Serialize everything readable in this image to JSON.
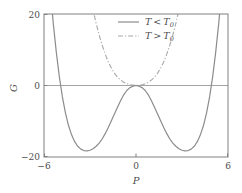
{
  "chart_data": {
    "type": "line",
    "title": "",
    "xlabel": "P",
    "ylabel": "G",
    "xlim": [
      -6,
      6
    ],
    "ylim": [
      -20,
      20
    ],
    "xticks": [
      -6,
      0,
      6
    ],
    "xtick_labels": [
      "−6",
      "0",
      "6"
    ],
    "yticks": [
      -20,
      0,
      20
    ],
    "ytick_labels": [
      "−20",
      "0",
      "20"
    ],
    "grid": false,
    "legend_position": "top-center",
    "zero_line": 0,
    "series": [
      {
        "name": "T < T0",
        "legend_label_main": "T",
        "legend_label_rel": "<",
        "legend_label_var": "T",
        "legend_label_sub": "0",
        "style": "solid",
        "color": "#8c8c8c",
        "form": "double-well",
        "description": "Double-well quartic: G = a(T-T0)P^2 + bP^4 with a(T-T0) < 0",
        "minima_x": [
          -3.2,
          3.2
        ],
        "minima_y": [
          -18.3,
          -18.3
        ],
        "local_max_x": 0,
        "local_max_y": 0,
        "x": [
          -5.6,
          -5.4,
          -5.2,
          -5.0,
          -4.8,
          -4.6,
          -4.4,
          -4.2,
          -4.0,
          -3.8,
          -3.6,
          -3.4,
          -3.2,
          -3.0,
          -2.8,
          -2.6,
          -2.4,
          -2.2,
          -2.0,
          -1.8,
          -1.6,
          -1.4,
          -1.2,
          -1.0,
          -0.8,
          -0.6,
          -0.4,
          -0.2,
          0.0,
          0.2,
          0.4,
          0.6,
          0.8,
          1.0,
          1.2,
          1.4,
          1.6,
          1.8,
          2.0,
          2.2,
          2.4,
          2.6,
          2.8,
          3.0,
          3.2,
          3.4,
          3.6,
          3.8,
          4.0,
          4.2,
          4.4,
          4.6,
          4.8,
          5.0,
          5.2,
          5.4,
          5.6
        ],
        "y": [
          27.2,
          17.6,
          9.4,
          2.5,
          -3.2,
          -7.7,
          -11.2,
          -13.8,
          -15.7,
          -17.0,
          -17.8,
          -18.2,
          -18.3,
          -18.1,
          -17.7,
          -17.0,
          -16.1,
          -14.9,
          -13.4,
          -11.7,
          -9.8,
          -7.9,
          -6.0,
          -4.2,
          -2.6,
          -1.4,
          -0.6,
          -0.2,
          0.0,
          -0.2,
          -0.6,
          -1.4,
          -2.6,
          -4.2,
          -6.0,
          -7.9,
          -9.8,
          -11.7,
          -13.4,
          -14.9,
          -16.1,
          -17.0,
          -17.7,
          -18.1,
          -18.3,
          -18.2,
          -17.8,
          -17.0,
          -15.7,
          -13.8,
          -11.2,
          -7.7,
          -3.2,
          2.5,
          9.4,
          17.6,
          27.2
        ]
      },
      {
        "name": "T > T0",
        "legend_label_main": "T",
        "legend_label_rel": ">",
        "legend_label_var": "T",
        "legend_label_sub": "0",
        "style": "dash-dot",
        "color": "#a8a8a8",
        "form": "single-well",
        "description": "Single-well quartic: G = a(T-T0)P^2 + bP^4 with a(T-T0) > 0",
        "minimum_x": 0,
        "minimum_y": 0,
        "x": [
          -3.0,
          -2.8,
          -2.6,
          -2.4,
          -2.2,
          -2.0,
          -1.8,
          -1.6,
          -1.4,
          -1.2,
          -1.0,
          -0.8,
          -0.6,
          -0.4,
          -0.2,
          0.0,
          0.2,
          0.4,
          0.6,
          0.8,
          1.0,
          1.2,
          1.4,
          1.6,
          1.8,
          2.0,
          2.2,
          2.4,
          2.6,
          2.8,
          3.0
        ],
        "y": [
          25.2,
          21.1,
          17.4,
          14.1,
          11.2,
          8.7,
          6.5,
          4.8,
          3.4,
          2.3,
          1.5,
          0.9,
          0.5,
          0.2,
          0.1,
          0.0,
          0.1,
          0.2,
          0.5,
          0.9,
          1.5,
          2.3,
          3.4,
          4.8,
          6.5,
          8.7,
          11.2,
          14.1,
          17.4,
          21.1,
          25.2
        ]
      }
    ]
  },
  "axes": {
    "y_top_label": "20",
    "y_zero_label": "0",
    "y_bottom_label": "−20",
    "x_left_label": "−6",
    "x_mid_label": "0",
    "x_right_label": "6",
    "x_axis_title": "P",
    "y_axis_title": "G"
  },
  "legend": {
    "entry1": {
      "var": "T",
      "rel": "<",
      "ref": "T",
      "sub": "0"
    },
    "entry2": {
      "var": "T",
      "rel": ">",
      "ref": "T",
      "sub": "0"
    }
  },
  "colors": {
    "frame": "#808080",
    "solid_curve": "#8c8c8c",
    "dashdot_curve": "#a8a8a8",
    "zero_line": "#9a9a9a",
    "text": "#4d4d4d",
    "background": "#ffffff"
  }
}
